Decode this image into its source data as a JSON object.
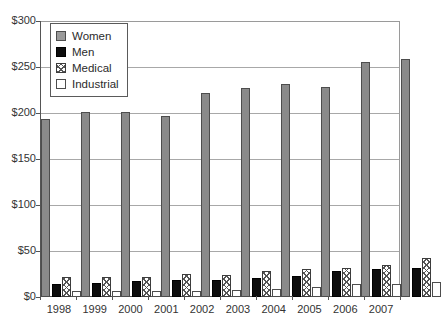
{
  "chart_data": {
    "type": "bar",
    "title": "",
    "xlabel": "",
    "ylabel": "",
    "ylim": [
      0,
      300
    ],
    "ytick_labels": [
      "$0",
      "$50",
      "$100",
      "$150",
      "$200",
      "$250",
      "$300"
    ],
    "ytick_values": [
      0,
      50,
      100,
      150,
      200,
      250,
      300
    ],
    "grid": true,
    "legend_position": "top-left",
    "categories": [
      "1998",
      "1999",
      "2000",
      "2001",
      "2002",
      "2003",
      "2004",
      "2005",
      "2006",
      "2007"
    ],
    "series": [
      {
        "name": "Women",
        "color": "#8a8a8a",
        "pattern": "solid-gray",
        "values": [
          194,
          201,
          201,
          197,
          222,
          227,
          231,
          228,
          255,
          259
        ]
      },
      {
        "name": "Men",
        "color": "#0d0d0d",
        "pattern": "solid-black",
        "values": [
          14,
          15,
          17,
          18,
          18,
          21,
          23,
          28,
          30,
          31
        ]
      },
      {
        "name": "Medical",
        "color": "#ffffff",
        "pattern": "crosshatch",
        "values": [
          22,
          22,
          22,
          25,
          24,
          28,
          30,
          32,
          35,
          42
        ]
      },
      {
        "name": "Industrial",
        "color": "#ffffff",
        "pattern": "empty",
        "values": [
          7,
          6,
          6,
          7,
          8,
          9,
          11,
          14,
          14,
          16
        ]
      }
    ]
  },
  "legend": {
    "items": [
      {
        "label": "Women"
      },
      {
        "label": "Men"
      },
      {
        "label": "Medical"
      },
      {
        "label": "Industrial"
      }
    ]
  }
}
